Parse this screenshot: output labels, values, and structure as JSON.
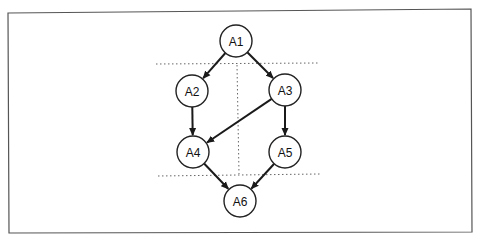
{
  "diagram": {
    "type": "directed-acyclic-graph",
    "nodes": [
      {
        "id": "A1",
        "label": "A1",
        "x": 236,
        "y": 41
      },
      {
        "id": "A2",
        "label": "A2",
        "x": 192,
        "y": 91
      },
      {
        "id": "A3",
        "label": "A3",
        "x": 285,
        "y": 90
      },
      {
        "id": "A4",
        "label": "A4",
        "x": 193,
        "y": 152
      },
      {
        "id": "A5",
        "label": "A5",
        "x": 285,
        "y": 152
      },
      {
        "id": "A6",
        "label": "A6",
        "x": 240,
        "y": 201
      }
    ],
    "edges": [
      {
        "from": "A1",
        "to": "A2"
      },
      {
        "from": "A1",
        "to": "A3"
      },
      {
        "from": "A2",
        "to": "A4"
      },
      {
        "from": "A3",
        "to": "A4"
      },
      {
        "from": "A3",
        "to": "A5"
      },
      {
        "from": "A4",
        "to": "A6"
      },
      {
        "from": "A5",
        "to": "A6"
      }
    ],
    "partition_lines": [
      {
        "orientation": "horizontal",
        "x1": 156,
        "y1": 64,
        "x2": 318,
        "y2": 63
      },
      {
        "orientation": "vertical",
        "x1": 237,
        "y1": 65,
        "x2": 239,
        "y2": 174
      },
      {
        "orientation": "horizontal",
        "x1": 158,
        "y1": 176,
        "x2": 320,
        "y2": 174
      }
    ],
    "node_radius": 16
  }
}
